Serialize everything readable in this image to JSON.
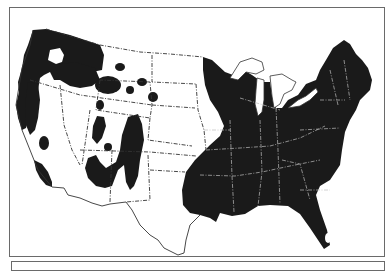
{
  "map": {
    "type": "species-range-map",
    "region": "Contiguous United States",
    "colors": {
      "range_fill": "#1a1a1a",
      "background": "#ffffff",
      "border": "#333333",
      "frame": "#6a6a6a"
    },
    "legend": {
      "shaded": "distribution range"
    },
    "ranges": [
      {
        "name": "eastern-range",
        "extent": "Minnesota/Great Lakes to Maine, south through eastern Texas to Florida"
      },
      {
        "name": "pacific-northwest-range",
        "extent": "Washington, Oregon, northern California, Idaho"
      },
      {
        "name": "rocky-mountain-patches",
        "extent": "Montana, Wyoming, Colorado, Utah, New Mexico, Arizona"
      },
      {
        "name": "southern-california-patch",
        "extent": "Southern California coast ranges"
      }
    ]
  },
  "caption": {
    "text": ""
  }
}
